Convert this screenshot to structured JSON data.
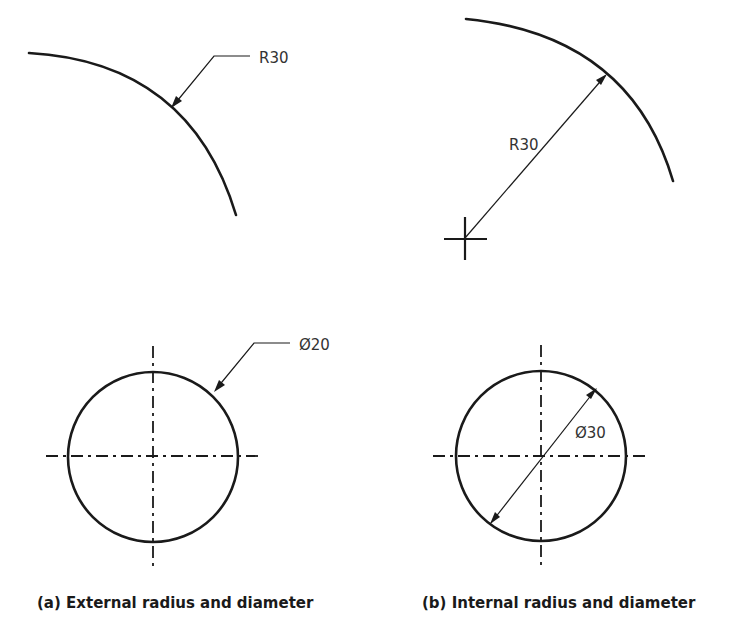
{
  "figures": {
    "a": {
      "caption": "(a) External radius and diameter",
      "radius_label": "R30",
      "diameter_label": "Ø20"
    },
    "b": {
      "caption": "(b) Internal radius and diameter",
      "radius_label": "R30",
      "diameter_label": "Ø30"
    }
  },
  "colors": {
    "line": "#1a1a1a",
    "text": "#333333",
    "background": "#ffffff"
  }
}
